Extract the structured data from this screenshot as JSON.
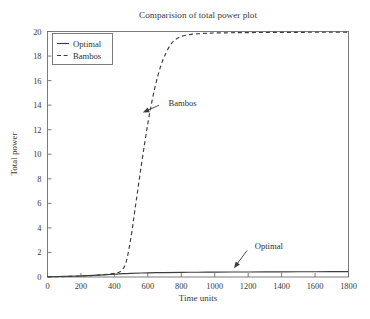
{
  "chart_data": {
    "type": "line",
    "title": "Comparision of total power plot",
    "xlabel": "Time units",
    "ylabel": "Total power",
    "xlim": [
      0,
      1800
    ],
    "ylim": [
      0,
      20
    ],
    "xticks": [
      0,
      200,
      400,
      600,
      800,
      1000,
      1200,
      1400,
      1600,
      1800
    ],
    "yticks": [
      0,
      2,
      4,
      6,
      8,
      10,
      12,
      14,
      16,
      18,
      20
    ],
    "xtick_labels": [
      "0",
      "200",
      "400",
      "600",
      "800",
      "1000",
      "1200",
      "1400",
      "1600",
      "1800"
    ],
    "ytick_labels": [
      "0",
      "2",
      "4",
      "6",
      "8",
      "10",
      "12",
      "14",
      "16",
      "18",
      "20"
    ],
    "grid": false,
    "legend_position": "upper-left",
    "legend_entries": [
      {
        "label": "Optimal",
        "style": "solid"
      },
      {
        "label": "Bambos",
        "style": "dashed"
      }
    ],
    "series": [
      {
        "name": "Optimal",
        "style": "solid",
        "color": "#3d3d3d",
        "x": [
          0,
          100,
          200,
          300,
          400,
          450,
          500,
          600,
          700,
          800,
          900,
          1000,
          1100,
          1200,
          1300,
          1400,
          1500,
          1600,
          1700,
          1800
        ],
        "y": [
          0.02,
          0.05,
          0.09,
          0.15,
          0.22,
          0.27,
          0.3,
          0.34,
          0.36,
          0.38,
          0.39,
          0.4,
          0.41,
          0.41,
          0.42,
          0.42,
          0.43,
          0.43,
          0.44,
          0.44
        ]
      },
      {
        "name": "Bambos",
        "style": "dashed",
        "color": "#3d3d3d",
        "x": [
          0,
          100,
          200,
          300,
          400,
          440,
          470,
          500,
          520,
          540,
          560,
          580,
          600,
          620,
          640,
          660,
          680,
          700,
          730,
          760,
          800,
          850,
          900,
          950,
          1000,
          1100,
          1200,
          1300,
          1400,
          1500,
          1600,
          1700,
          1800
        ],
        "y": [
          0.02,
          0.04,
          0.08,
          0.15,
          0.3,
          0.5,
          1.2,
          3.3,
          5.2,
          7.1,
          9.0,
          10.8,
          12.5,
          14.0,
          15.3,
          16.4,
          17.3,
          18.0,
          18.8,
          19.3,
          19.6,
          19.75,
          19.82,
          19.86,
          19.88,
          19.9,
          19.91,
          19.92,
          19.93,
          19.93,
          19.94,
          19.94,
          19.94
        ]
      }
    ],
    "annotations": [
      {
        "text": "Bambos",
        "label_x": 700,
        "label_y": 14.2,
        "point_x": 570,
        "point_y": 13.4
      },
      {
        "text": "Optimal",
        "label_x": 1215,
        "label_y": 2.55,
        "point_x": 1115,
        "point_y": 0.72
      }
    ]
  }
}
